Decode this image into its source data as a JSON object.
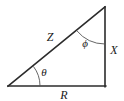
{
  "figure": {
    "type": "right-triangle-diagram",
    "background_color": "#ffffff",
    "line_color": "#2b2b2b",
    "arc_color": "#555555",
    "text_color": "#1a1a1a",
    "vertices": {
      "left": {
        "x": 8,
        "y": 86
      },
      "bottom_right": {
        "x": 105,
        "y": 86
      },
      "top_right": {
        "x": 105,
        "y": 7
      }
    },
    "sides": [
      {
        "name": "hypotenuse",
        "label": "Z",
        "label_x": 50,
        "label_y": 41,
        "from": "left",
        "to": "top_right"
      },
      {
        "name": "vertical-leg",
        "label": "X",
        "label_x": 114,
        "label_y": 54,
        "from": "top_right",
        "to": "bottom_right"
      },
      {
        "name": "horizontal-leg",
        "label": "R",
        "label_x": 64,
        "label_y": 99,
        "from": "left",
        "to": "bottom_right"
      }
    ],
    "angles": [
      {
        "name": "theta",
        "label": "θ",
        "label_x": 44,
        "label_y": 76,
        "at_vertex": "left",
        "between": [
          "horizontal-leg",
          "hypotenuse"
        ]
      },
      {
        "name": "phi",
        "label": "ϕ",
        "label_x": 85,
        "label_y": 47,
        "at_vertex": "top_right",
        "between": [
          "hypotenuse",
          "vertical-leg"
        ]
      }
    ]
  }
}
